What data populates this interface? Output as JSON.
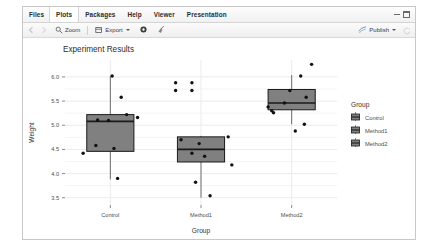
{
  "window": {
    "tabs": [
      {
        "label": "Files",
        "active": false
      },
      {
        "label": "Plots",
        "active": true
      },
      {
        "label": "Packages",
        "active": false
      },
      {
        "label": "Help",
        "active": false
      },
      {
        "label": "Viewer",
        "active": false
      },
      {
        "label": "Presentation",
        "active": false
      }
    ],
    "controls": {
      "minimize": "minimize-icon",
      "maximize": "maximize-icon"
    }
  },
  "toolbar": {
    "back": "back-arrow-icon",
    "forward": "forward-arrow-icon",
    "zoom_label": "Zoom",
    "zoom_icon": "magnifier-icon",
    "export_label": "Export",
    "export_icon": "export-icon",
    "export_caret": "chevron-down-icon",
    "remove_icon": "gear-icon",
    "clear_icon": "broom-icon",
    "publish_label": "Publish",
    "publish_icon": "publish-icon",
    "publish_caret": "chevron-down-icon",
    "refresh_icon": "refresh-icon"
  },
  "chart_data": {
    "type": "boxplot",
    "title": "Experiment Results",
    "xlabel": "Group",
    "ylabel": "Weight",
    "categories": [
      "Control",
      "Method1",
      "Method2"
    ],
    "ylim": [
      3.35,
      6.35
    ],
    "yticks": [
      3.5,
      4.0,
      4.5,
      5.0,
      5.5,
      6.0
    ],
    "ytick_labels": [
      "3.5",
      "4.0",
      "4.5",
      "5.0",
      "5.5",
      "6.0"
    ],
    "grid": true,
    "legend": {
      "title": "Group",
      "position": "right",
      "entries": [
        "Control",
        "Method1",
        "Method2"
      ]
    },
    "box_fill": "#808080",
    "box_stroke": "#1a1a1a",
    "point_color": "#111111",
    "panel_background": "#ffffff",
    "grid_color": "#ebebeb",
    "boxes": [
      {
        "category": "Control",
        "lower_whisker": 3.88,
        "q1": 4.46,
        "median": 5.08,
        "q3": 5.22,
        "upper_whisker": 6.02,
        "points": [
          {
            "x_offset": -0.3,
            "y": 4.42
          },
          {
            "x_offset": -0.14,
            "y": 5.11
          },
          {
            "x_offset": -0.02,
            "y": 5.1
          },
          {
            "x_offset": 0.18,
            "y": 5.22
          },
          {
            "x_offset": 0.3,
            "y": 5.16
          },
          {
            "x_offset": -0.16,
            "y": 4.58
          },
          {
            "x_offset": 0.04,
            "y": 4.52
          },
          {
            "x_offset": 0.02,
            "y": 6.02
          },
          {
            "x_offset": 0.12,
            "y": 5.58
          },
          {
            "x_offset": 0.08,
            "y": 3.9
          }
        ]
      },
      {
        "category": "Method1",
        "lower_whisker": 3.5,
        "q1": 4.24,
        "median": 4.5,
        "q3": 4.76,
        "upper_whisker": 4.78,
        "points": [
          {
            "x_offset": -0.22,
            "y": 4.7
          },
          {
            "x_offset": -0.02,
            "y": 4.62
          },
          {
            "x_offset": -0.1,
            "y": 4.42
          },
          {
            "x_offset": 0.04,
            "y": 4.36
          },
          {
            "x_offset": 0.3,
            "y": 4.76
          },
          {
            "x_offset": 0.34,
            "y": 4.18
          },
          {
            "x_offset": -0.06,
            "y": 3.82
          },
          {
            "x_offset": 0.1,
            "y": 3.54
          },
          {
            "x_offset": -0.28,
            "y": 5.88
          },
          {
            "x_offset": -0.1,
            "y": 5.88
          },
          {
            "x_offset": -0.28,
            "y": 5.72
          },
          {
            "x_offset": -0.1,
            "y": 5.72
          }
        ]
      },
      {
        "category": "Method2",
        "lower_whisker": 5.02,
        "q1": 5.32,
        "median": 5.46,
        "q3": 5.74,
        "upper_whisker": 6.04,
        "points": [
          {
            "x_offset": -0.26,
            "y": 5.38
          },
          {
            "x_offset": -0.22,
            "y": 5.3
          },
          {
            "x_offset": -0.2,
            "y": 5.26
          },
          {
            "x_offset": -0.08,
            "y": 5.46
          },
          {
            "x_offset": -0.02,
            "y": 5.72
          },
          {
            "x_offset": 0.16,
            "y": 5.58
          },
          {
            "x_offset": 0.22,
            "y": 6.26
          },
          {
            "x_offset": 0.1,
            "y": 6.02
          },
          {
            "x_offset": 0.14,
            "y": 5.02
          },
          {
            "x_offset": 0.04,
            "y": 4.88
          }
        ]
      }
    ]
  }
}
